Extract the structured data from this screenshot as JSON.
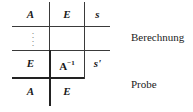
{
  "table": {
    "row1": [
      "A",
      "E",
      "s"
    ],
    "row2": [
      "⋮",
      "",
      ""
    ],
    "row3": [
      "E",
      "A",
      "s'"
    ],
    "row3_sup": "−1",
    "row4": [
      "A",
      "E"
    ]
  },
  "labels": {
    "calc": "Berechnung",
    "check": "Probe"
  }
}
